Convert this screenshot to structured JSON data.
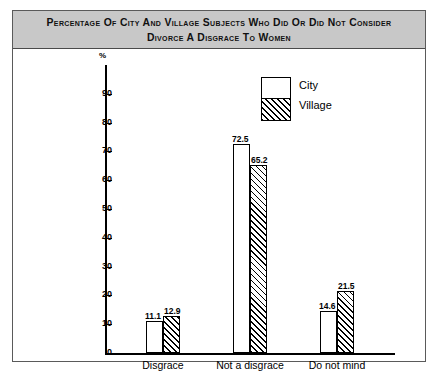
{
  "figure": {
    "title_line_1": "Percentage of City and Village Subjects Who Did or Did Not Consider",
    "title_line_2": "Divorce a Disgrace to Women"
  },
  "chart_data": {
    "type": "bar",
    "title": "Percentage of City and Village Subjects Who Did or Did Not Consider Divorce a Disgrace to Women",
    "categories": [
      "Disgrace",
      "Not a disgrace",
      "Do not mind"
    ],
    "series": [
      {
        "name": "City",
        "values": [
          11.1,
          72.5,
          14.6
        ],
        "fill": "white"
      },
      {
        "name": "Village",
        "values": [
          12.9,
          65.2,
          21.5
        ],
        "fill": "hatched"
      }
    ],
    "xlabel": "",
    "ylabel": "%",
    "ylim": [
      0,
      100
    ],
    "yticks": [
      0,
      10,
      20,
      30,
      40,
      50,
      60,
      70,
      80,
      90
    ],
    "ytick_labels": [
      "0",
      "10",
      "20",
      "30",
      "40",
      "50",
      "60",
      "70",
      "80",
      "90"
    ],
    "y_axis_unit": "%",
    "grid": false,
    "legend_position": "top-center-right",
    "data_labels": [
      "11.1",
      "12.9",
      "72.5",
      "65.2",
      "14.6",
      "21.5"
    ],
    "colors": {
      "banner": "#c8c8c8",
      "axis": "#000000",
      "frame": "#5a5a5a",
      "city_fill": "#ffffff",
      "village_fill": "#ffffff"
    }
  },
  "legend": {
    "items": [
      {
        "label": "City"
      },
      {
        "label": "Village"
      }
    ]
  }
}
